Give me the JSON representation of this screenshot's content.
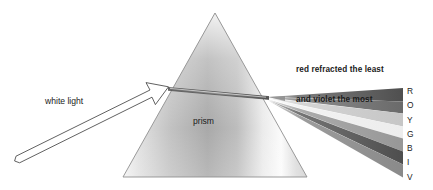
{
  "figure": {
    "background_color": "#ffffff",
    "width": 433,
    "height": 190
  },
  "labels": {
    "white_light": "white light",
    "prism": "prism",
    "caption_line_1": "red refracted the least",
    "caption_line_2": "and violet the most",
    "caption_full": "red refracted the least\nand violet the most"
  },
  "spectrum_legend": {
    "letters": [
      "R",
      "O",
      "Y",
      "G",
      "B",
      "I",
      "V"
    ],
    "names": [
      "red",
      "orange",
      "yellow",
      "green",
      "blue",
      "indigo",
      "violet"
    ]
  },
  "chart_data": {
    "type": "diagram",
    "prism": {
      "shape": "triangle",
      "apex": [
        215,
        13
      ],
      "base_left": [
        123,
        177
      ],
      "base_right": [
        307,
        177
      ],
      "fill_description": "vertical silver gradient, bright near left edge, mid-gray body, highlight near right face",
      "outline_color": "#8a8a8a"
    },
    "incident_beam": {
      "label": "white light",
      "type": "arrow",
      "start": [
        16,
        161
      ],
      "tip": [
        168,
        87
      ],
      "stroke": "#3a3a3a",
      "fill": "#ffffff"
    },
    "refracted_fan": {
      "origin": [
        268,
        97
      ],
      "right_edge_x": 403,
      "bands": [
        {
          "letter": "R",
          "name": "red",
          "gray": "#585858",
          "y_at_right": 95
        },
        {
          "letter": "O",
          "name": "orange",
          "gray": "#6e6e6e",
          "y_at_right": 107
        },
        {
          "letter": "Y",
          "name": "yellow",
          "gray": "#c9c9c9",
          "y_at_right": 120
        },
        {
          "letter": "G",
          "name": "green",
          "gray": "#efefef",
          "y_at_right": 132
        },
        {
          "letter": "B",
          "name": "blue",
          "gray": "#9a9a9a",
          "y_at_right": 145
        },
        {
          "letter": "I",
          "name": "indigo",
          "gray": "#565656",
          "y_at_right": 158
        },
        {
          "letter": "V",
          "name": "violet",
          "gray": "#8d8d8d",
          "y_at_right": 171
        }
      ],
      "note": "grayscale rendering of the visible spectrum; red deviates least, violet most"
    }
  },
  "colors": {
    "text": "#1a1a1a",
    "prism_outline": "#8a8a8a",
    "beam_stroke": "#3a3a3a",
    "background": "#ffffff"
  }
}
